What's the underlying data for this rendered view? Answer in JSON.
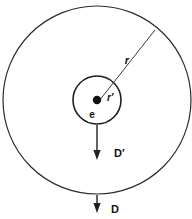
{
  "figure": {
    "background_color": "#ffffff",
    "stroke_color": "#2b2b2b",
    "label_color": "#111111"
  },
  "geometry": {
    "center": {
      "x": 97,
      "y": 100
    },
    "outer_circle": {
      "radius": 94,
      "label": "r"
    },
    "inner_circle": {
      "radius": 24,
      "label": "r'"
    },
    "charge_dot": {
      "radius": 4
    }
  },
  "labels": {
    "outer_radius": "r",
    "inner_radius": "r′",
    "charge": "e",
    "inner_field": "D′",
    "outer_field": "D"
  },
  "annotations": [
    {
      "name": "outer-radius-label",
      "text": "r",
      "x": 127,
      "y": 64
    },
    {
      "name": "inner-radius-label",
      "text": "r′",
      "x": 107,
      "y": 101
    },
    {
      "name": "charge-label",
      "text": "e",
      "x": 92,
      "y": 118
    },
    {
      "name": "inner-field-label",
      "text": "D′",
      "x": 114,
      "y": 157
    },
    {
      "name": "outer-field-label",
      "text": "D",
      "x": 111,
      "y": 213
    }
  ],
  "arrows": [
    {
      "name": "inner-displacement-arrow",
      "label": "D′",
      "from": {
        "x": 97,
        "y": 125
      },
      "to": {
        "x": 97,
        "y": 159
      },
      "direction": "down"
    },
    {
      "name": "outer-displacement-arrow",
      "label": "D",
      "from": {
        "x": 97,
        "y": 195
      },
      "to": {
        "x": 97,
        "y": 212
      },
      "direction": "down"
    }
  ],
  "radius_line": {
    "name": "outer-radius-pointer",
    "from": {
      "x": 99,
      "y": 101
    },
    "to": {
      "x": 155,
      "y": 30
    }
  }
}
